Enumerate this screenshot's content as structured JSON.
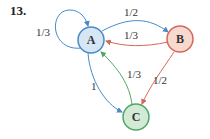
{
  "problem": {
    "number": "13."
  },
  "nodes": [
    {
      "id": "A",
      "label": "A",
      "fill": "#d6e6f5",
      "stroke": "#4a8ac6"
    },
    {
      "id": "B",
      "label": "B",
      "fill": "#f7d9d0",
      "stroke": "#d4685a"
    },
    {
      "id": "C",
      "label": "C",
      "fill": "#d3ead7",
      "stroke": "#4ea763"
    }
  ],
  "edges": [
    {
      "from": "A",
      "to": "A",
      "label": "1/3",
      "color": "#4a8ac6"
    },
    {
      "from": "A",
      "to": "B",
      "label": "1/2",
      "color": "#4a8ac6"
    },
    {
      "from": "B",
      "to": "A",
      "label": "1/3",
      "color": "#d4685a"
    },
    {
      "from": "C",
      "to": "A",
      "label": "1/3",
      "color": "#4ea763"
    },
    {
      "from": "A",
      "to": "C",
      "label": "1",
      "color": "#4a8ac6"
    },
    {
      "from": "B",
      "to": "C",
      "label": "1/2",
      "color": "#d4685a"
    }
  ]
}
